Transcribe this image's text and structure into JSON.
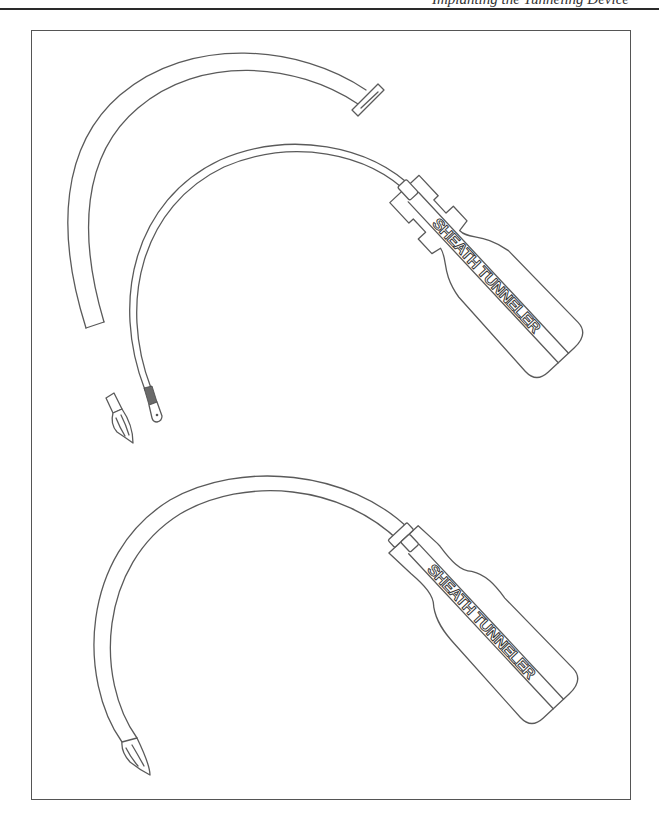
{
  "page": {
    "header_text": "Implanting the Tunneling Device",
    "header_rule": true
  },
  "figure": {
    "frame_color": "#555555",
    "line_color": "#5a5a5a",
    "instruments": [
      {
        "id": "disassembled",
        "position": "top",
        "parts": [
          "sheath",
          "tunneler-rod",
          "handle",
          "bullet-tip"
        ],
        "handle_label": "SHEATH TUNNELER"
      },
      {
        "id": "assembled",
        "position": "bottom",
        "parts": [
          "sheath",
          "handle",
          "bullet-tip"
        ],
        "handle_label": "SHEATH TUNNELER"
      }
    ]
  }
}
